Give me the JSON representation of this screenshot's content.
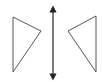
{
  "diagram": {
    "stroke_color": "#555555",
    "arrow_color": "#222222",
    "background": "#ffffff",
    "left_triangle": {
      "points": "13,17 41,31 13,72"
    },
    "right_triangle": {
      "points": "96,16 68,31 96,72"
    },
    "mirror_line": {
      "x": 53,
      "y1": 6,
      "y2": 80
    }
  }
}
